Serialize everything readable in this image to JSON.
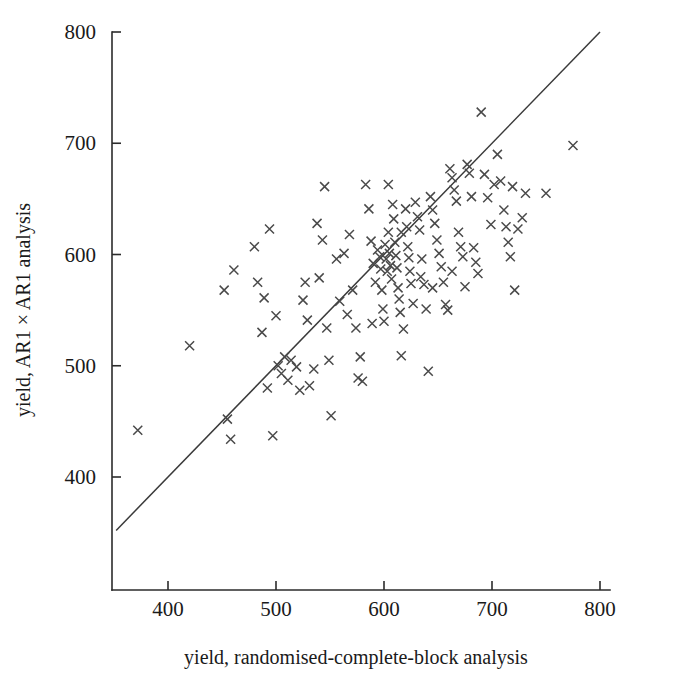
{
  "figure": {
    "background": "#ffffff",
    "ink_color": "#3a3a3a",
    "marker_color": "#4a4a4a"
  },
  "chart_data": {
    "type": "scatter",
    "title": "",
    "xlabel": "yield, randomised-complete-block analysis",
    "ylabel": "yield, AR1 × AR1 analysis",
    "xlim": [
      352,
      812
    ],
    "ylim": [
      355,
      805
    ],
    "xticks": [
      400,
      500,
      600,
      700,
      800
    ],
    "yticks": [
      400,
      500,
      600,
      700,
      800
    ],
    "xtick_labels": [
      "400",
      "500",
      "600",
      "700",
      "800"
    ],
    "ytick_labels": [
      "400",
      "500",
      "600",
      "700",
      "800"
    ],
    "grid": false,
    "legend": null,
    "marker": "x",
    "marker_size": 9,
    "reference_line": {
      "type": "identity",
      "label": "y = x",
      "x": [
        352,
        800
      ],
      "y": [
        352,
        800
      ]
    },
    "n_points": 131,
    "points": [
      [
        372,
        442
      ],
      [
        420,
        518
      ],
      [
        452,
        568
      ],
      [
        455,
        452
      ],
      [
        458,
        434
      ],
      [
        461,
        586
      ],
      [
        480,
        607
      ],
      [
        483,
        575
      ],
      [
        487,
        530
      ],
      [
        489,
        561
      ],
      [
        492,
        480
      ],
      [
        494,
        623
      ],
      [
        497,
        437
      ],
      [
        500,
        545
      ],
      [
        502,
        500
      ],
      [
        505,
        493
      ],
      [
        508,
        508
      ],
      [
        511,
        487
      ],
      [
        514,
        505
      ],
      [
        519,
        499
      ],
      [
        522,
        478
      ],
      [
        525,
        559
      ],
      [
        527,
        575
      ],
      [
        529,
        541
      ],
      [
        531,
        482
      ],
      [
        535,
        497
      ],
      [
        538,
        628
      ],
      [
        540,
        579
      ],
      [
        543,
        613
      ],
      [
        545,
        661
      ],
      [
        547,
        534
      ],
      [
        549,
        505
      ],
      [
        551,
        455
      ],
      [
        556,
        596
      ],
      [
        559,
        558
      ],
      [
        563,
        601
      ],
      [
        566,
        546
      ],
      [
        568,
        618
      ],
      [
        571,
        568
      ],
      [
        574,
        534
      ],
      [
        576,
        489
      ],
      [
        578,
        508
      ],
      [
        580,
        486
      ],
      [
        583,
        663
      ],
      [
        586,
        641
      ],
      [
        588,
        612
      ],
      [
        590,
        592
      ],
      [
        592,
        575
      ],
      [
        594,
        604
      ],
      [
        596,
        598
      ],
      [
        597,
        587
      ],
      [
        598,
        568
      ],
      [
        599,
        551
      ],
      [
        600,
        540
      ],
      [
        601,
        609
      ],
      [
        602,
        596
      ],
      [
        603,
        585
      ],
      [
        604,
        620
      ],
      [
        605,
        601
      ],
      [
        606,
        590
      ],
      [
        607,
        578
      ],
      [
        608,
        645
      ],
      [
        609,
        632
      ],
      [
        610,
        611
      ],
      [
        611,
        599
      ],
      [
        612,
        588
      ],
      [
        613,
        570
      ],
      [
        614,
        560
      ],
      [
        615,
        548
      ],
      [
        616,
        509
      ],
      [
        618,
        533
      ],
      [
        620,
        641
      ],
      [
        621,
        625
      ],
      [
        622,
        607
      ],
      [
        623,
        597
      ],
      [
        624,
        585
      ],
      [
        625,
        574
      ],
      [
        627,
        556
      ],
      [
        629,
        647
      ],
      [
        631,
        634
      ],
      [
        633,
        622
      ],
      [
        635,
        596
      ],
      [
        637,
        573
      ],
      [
        639,
        551
      ],
      [
        641,
        495
      ],
      [
        643,
        652
      ],
      [
        645,
        640
      ],
      [
        647,
        628
      ],
      [
        649,
        613
      ],
      [
        651,
        601
      ],
      [
        653,
        589
      ],
      [
        655,
        575
      ],
      [
        657,
        555
      ],
      [
        659,
        550
      ],
      [
        661,
        677
      ],
      [
        663,
        669
      ],
      [
        665,
        658
      ],
      [
        667,
        648
      ],
      [
        669,
        620
      ],
      [
        671,
        607
      ],
      [
        673,
        598
      ],
      [
        675,
        571
      ],
      [
        677,
        681
      ],
      [
        679,
        673
      ],
      [
        681,
        652
      ],
      [
        683,
        606
      ],
      [
        685,
        593
      ],
      [
        687,
        583
      ],
      [
        690,
        728
      ],
      [
        693,
        672
      ],
      [
        696,
        651
      ],
      [
        699,
        627
      ],
      [
        702,
        663
      ],
      [
        705,
        690
      ],
      [
        708,
        666
      ],
      [
        711,
        640
      ],
      [
        713,
        625
      ],
      [
        715,
        611
      ],
      [
        717,
        598
      ],
      [
        719,
        661
      ],
      [
        721,
        568
      ],
      [
        724,
        623
      ],
      [
        728,
        633
      ],
      [
        731,
        655
      ],
      [
        750,
        655
      ],
      [
        775,
        698
      ],
      [
        604,
        663
      ],
      [
        589,
        538
      ],
      [
        616,
        620
      ],
      [
        634,
        580
      ],
      [
        663,
        585
      ],
      [
        645,
        570
      ]
    ]
  }
}
